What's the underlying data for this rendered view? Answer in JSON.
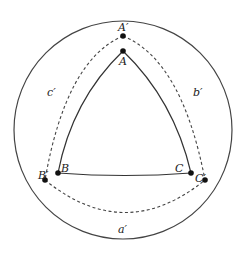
{
  "diagram": {
    "outer_circle": {
      "cx": 123,
      "cy": 130,
      "r": 109
    },
    "points": {
      "A": {
        "label": "A",
        "x": 123,
        "y": 51
      },
      "B": {
        "label": "B",
        "x": 58,
        "y": 173
      },
      "C": {
        "label": "C",
        "x": 191,
        "y": 173
      },
      "A_prime": {
        "label": "A′",
        "x": 123,
        "y": 36
      },
      "B_prime": {
        "label": "B′",
        "x": 45,
        "y": 180
      },
      "C_prime": {
        "label": "C′",
        "x": 205,
        "y": 180
      }
    },
    "side_labels": {
      "a_prime": "a′",
      "b_prime": "b′",
      "c_prime": "c′"
    },
    "colors": {
      "stroke": "#333333",
      "point": "#111111"
    }
  }
}
